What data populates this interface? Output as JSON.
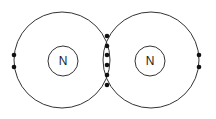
{
  "diagram": {
    "type": "dot-and-cross bonding diagram",
    "atoms": [
      {
        "symbol": "N",
        "cx": 62,
        "cy": 60,
        "shell_r": 48,
        "nucleus_r": 15
      },
      {
        "symbol": "N",
        "cx": 151,
        "cy": 60,
        "shell_r": 48,
        "nucleus_r": 15
      }
    ],
    "lone_pair_left": [
      {
        "x": 14,
        "y": 55
      },
      {
        "x": 14,
        "y": 67
      }
    ],
    "lone_pair_right": [
      {
        "x": 199,
        "y": 55
      },
      {
        "x": 199,
        "y": 67
      }
    ],
    "shared_electrons": [
      {
        "x": 107,
        "y": 36
      },
      {
        "x": 107,
        "y": 46
      },
      {
        "x": 107,
        "y": 55
      },
      {
        "x": 107,
        "y": 65
      },
      {
        "x": 107,
        "y": 75
      },
      {
        "x": 107,
        "y": 85
      }
    ],
    "colors": {
      "stroke": "#333333",
      "fill": "#111111"
    }
  }
}
